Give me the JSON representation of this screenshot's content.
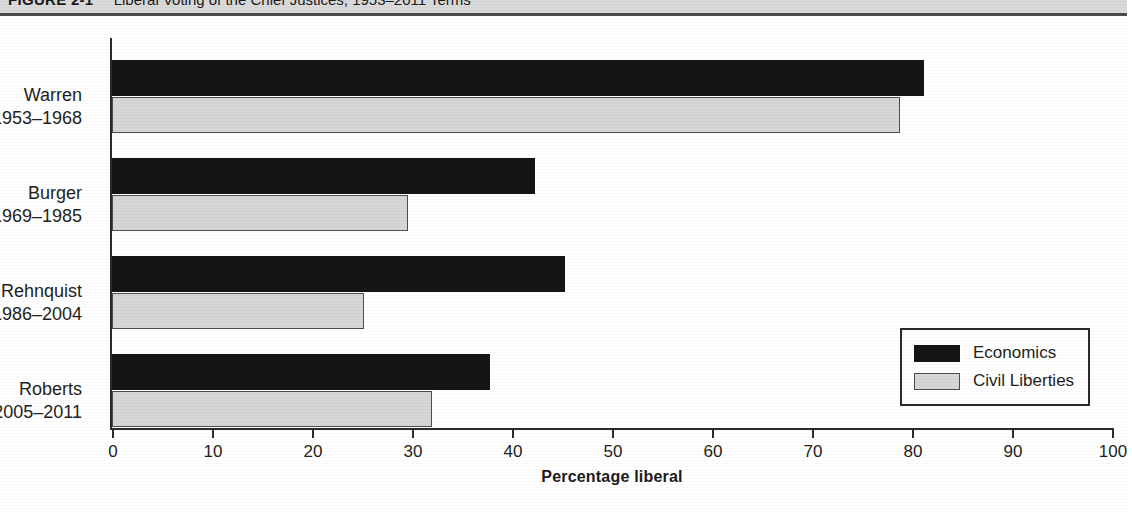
{
  "caption": {
    "figure_number": "FIGURE 2-1",
    "title": "Liberal Voting of the Chief Justices, 1953–2011 Terms"
  },
  "colors": {
    "economics": "#151515",
    "civil_liberties": "#d6d6d6",
    "civil_liberties_border": "#4d4d4d",
    "axis": "#2b2b2b",
    "caption_bar": "#d9d9d9",
    "text": "#231f20"
  },
  "axis": {
    "x_title": "Percentage liberal",
    "x_ticks": [
      "0",
      "10",
      "20",
      "30",
      "40",
      "50",
      "60",
      "70",
      "80",
      "90",
      "100"
    ]
  },
  "legend": {
    "items": [
      {
        "label": "Economics",
        "swatch": "economics"
      },
      {
        "label": "Civil Liberties",
        "swatch": "civil_liberties"
      }
    ]
  },
  "categories": [
    {
      "name": "Warren",
      "years": "1953–1968"
    },
    {
      "name": "Burger",
      "years": "1969–1985"
    },
    {
      "name": "Rehnquist",
      "years": "1986–2004"
    },
    {
      "name": "Roberts",
      "years": "2005–2011"
    }
  ],
  "chart_data": {
    "type": "bar",
    "orientation": "horizontal",
    "title": "Liberal Voting of the Chief Justices, 1953–2011 Terms",
    "xlabel": "Percentage liberal",
    "ylabel": "",
    "xlim": [
      0,
      100
    ],
    "xticks": [
      0,
      10,
      20,
      30,
      40,
      50,
      60,
      70,
      80,
      90,
      100
    ],
    "grid": false,
    "legend_position": "inside lower-right",
    "categories": [
      "Warren 1953–1968",
      "Burger 1969–1985",
      "Rehnquist 1986–2004",
      "Roberts 2005–2011"
    ],
    "series": [
      {
        "name": "Economics",
        "values": [
          81.2,
          42.3,
          45.3,
          37.8
        ]
      },
      {
        "name": "Civil Liberties",
        "values": [
          78.8,
          29.6,
          25.2,
          32.0
        ]
      }
    ]
  }
}
